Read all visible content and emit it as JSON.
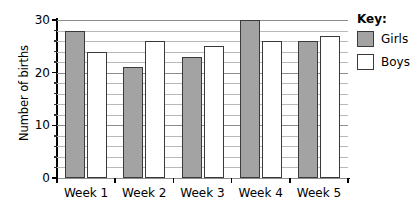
{
  "chart_data": {
    "type": "bar",
    "title": "",
    "xlabel": "",
    "ylabel": "Number of births",
    "categories": [
      "Week 1",
      "Week 2",
      "Week 3",
      "Week 4",
      "Week 5"
    ],
    "series": [
      {
        "name": "Girls",
        "color": "#a3a3a3",
        "values": [
          28,
          21,
          23,
          30,
          26
        ]
      },
      {
        "name": "Boys",
        "color": "#ffffff",
        "values": [
          24,
          26,
          25,
          26,
          27
        ]
      }
    ],
    "ylim": [
      0,
      30
    ],
    "ytick_labels": [
      "0",
      "10",
      "20",
      "30"
    ],
    "ytick_values": [
      0,
      10,
      20,
      30
    ],
    "minor_tick_step": 2,
    "grid": true,
    "legend_position": "right"
  },
  "legend": {
    "title": "Key:",
    "entries": [
      {
        "label": "Girls",
        "color": "#a3a3a3"
      },
      {
        "label": "Boys",
        "color": "#ffffff"
      }
    ]
  }
}
